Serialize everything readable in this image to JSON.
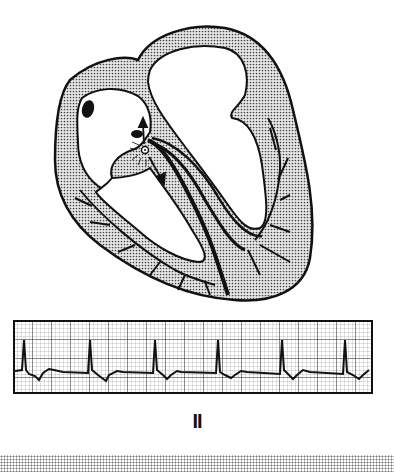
{
  "figure": {
    "type": "cardiac conduction diagram with ECG rhythm strip",
    "heart": {
      "view": "four-chamber cross-section with conduction pathway",
      "highlight": "junctional (AV node) impulse origin with arrows pointing up (retrograde to atria) and down (antegrade to ventricles)",
      "colors": {
        "myocardium_fill": "#c8c8c8",
        "outline": "#111111",
        "chamber": "#ffffff"
      }
    },
    "ecg": {
      "lead": "II",
      "beats": 6,
      "rhythm": "regular narrow-QRS, no visible preceding P waves",
      "grid_color": "#333333"
    }
  }
}
